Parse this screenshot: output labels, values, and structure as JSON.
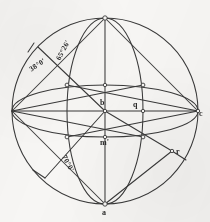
{
  "figure": {
    "title_hidden": "",
    "background_color": "#f7f6f4",
    "ink_color": "#3a3a3a",
    "canvas": {
      "width": 210,
      "height": 222
    }
  },
  "point_labels": [
    {
      "id": "b",
      "text": "b",
      "x": 100,
      "y": 105
    },
    {
      "id": "q",
      "text": "q",
      "x": 133,
      "y": 106
    },
    {
      "id": "c",
      "text": "c",
      "x": 198,
      "y": 113
    },
    {
      "id": "r",
      "text": "r",
      "x": 176,
      "y": 152
    },
    {
      "id": "m",
      "text": "m'",
      "x": 101,
      "y": 140
    },
    {
      "id": "a",
      "text": "a",
      "x": 103,
      "y": 213
    }
  ],
  "angle_labels": [
    {
      "id": "ang-38",
      "text": "38°0'",
      "x": 33,
      "y": 68,
      "rotate": -33
    },
    {
      "id": "ang-65-26",
      "text": "65°26'",
      "x": 60,
      "y": 50,
      "rotate": -62
    },
    {
      "id": "ang-70",
      "text": "70°0'",
      "x": 68,
      "y": 160,
      "rotate": 62
    }
  ],
  "geometry": {
    "outer_circle": {
      "cx": 105,
      "cy": 111,
      "r": 93
    },
    "center": {
      "cx": 105,
      "cy": 111
    },
    "vertical_axis": {
      "x": 105,
      "y_top": 18,
      "y_bottom": 204
    },
    "horizontal_axis": {
      "y": 111,
      "x_left": 12,
      "x_right": 198
    },
    "inner_meridians": [
      {
        "id": "meridian-left",
        "rx": 38
      },
      {
        "id": "meridian-right",
        "rx": 38
      }
    ],
    "equator_ellipses": [
      {
        "id": "equator-upper",
        "ry": 26
      },
      {
        "id": "equator-lower",
        "ry": 26
      }
    ],
    "node_markers": [
      {
        "id": "node-top",
        "x": 105,
        "y": 18
      },
      {
        "id": "node-bottom",
        "x": 105,
        "y": 204
      },
      {
        "id": "node-ul",
        "x": 67,
        "y": 85
      },
      {
        "id": "node-ur",
        "x": 143,
        "y": 85
      },
      {
        "id": "node-ll",
        "x": 67,
        "y": 137
      },
      {
        "id": "node-lr",
        "x": 143,
        "y": 137
      },
      {
        "id": "node-center",
        "x": 105,
        "y": 111
      },
      {
        "id": "node-q",
        "x": 143,
        "y": 111
      },
      {
        "id": "node-m",
        "x": 105,
        "y": 137
      },
      {
        "id": "node-mid-up",
        "x": 105,
        "y": 85
      },
      {
        "id": "node-c",
        "x": 198,
        "y": 111
      },
      {
        "id": "node-r",
        "x": 172,
        "y": 151
      }
    ]
  }
}
